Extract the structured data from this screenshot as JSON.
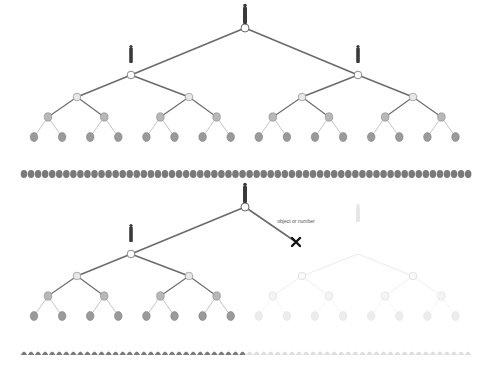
{
  "diagram": {
    "colors": {
      "edge": "#6a6a6a",
      "node_fill": "#ffffff",
      "node_gray": "#a8a8a8",
      "leaf": "#7a7a7a",
      "faded": "#dcdcdc",
      "person": "#3a3a3a",
      "cross": "#111111"
    },
    "panels": [
      {
        "name": "intact-tree",
        "top": 28,
        "failed_branch": false
      },
      {
        "name": "failed-tree",
        "top": 207,
        "failed_branch": true
      }
    ],
    "failure_label": "object or number",
    "failure_marker": "X"
  }
}
